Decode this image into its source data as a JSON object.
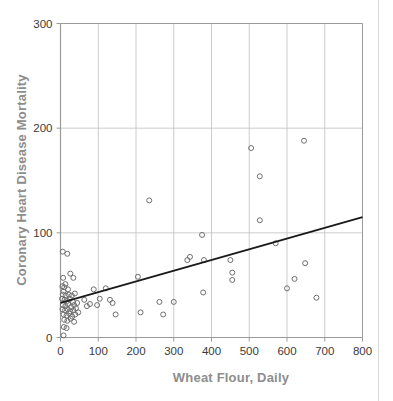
{
  "figure": {
    "background_color": "#ffffff",
    "plot_frame_color": "#9a9a9a",
    "gridline_color": "#bfbfbf",
    "marker_color": "#6f6f6f",
    "trend_line_color": "#1a1a1a",
    "tick_label_color": "#3a3a3a",
    "axis_title_color": "#8d8d8d"
  },
  "chart_data": {
    "type": "scatter",
    "title": "",
    "xlabel": "Wheat Flour, Daily",
    "ylabel": "Coronary Heart Disease Mortality",
    "xlim": [
      0,
      800
    ],
    "ylim": [
      0,
      300
    ],
    "xticks": [
      0,
      100,
      200,
      300,
      400,
      500,
      600,
      700,
      800
    ],
    "yticks": [
      0,
      100,
      200,
      300
    ],
    "xtick_labels": [
      "0",
      "100",
      "200",
      "300",
      "400",
      "500",
      "600",
      "700",
      "800"
    ],
    "ytick_labels": [
      "0",
      "100",
      "200",
      "300"
    ],
    "grid": "vertical-and-horizontal",
    "legend": "none",
    "marker_style": "open-circle",
    "marker_size": 5,
    "trend_line": {
      "label": "linear fit",
      "x_start": 0,
      "y_start": 33,
      "x_end": 800,
      "y_end": 115
    },
    "points": [
      [
        6,
        82
      ],
      [
        18,
        80
      ],
      [
        7,
        57
      ],
      [
        26,
        61
      ],
      [
        34,
        57
      ],
      [
        5,
        49
      ],
      [
        10,
        48
      ],
      [
        13,
        51
      ],
      [
        20,
        46
      ],
      [
        8,
        44
      ],
      [
        6,
        41
      ],
      [
        14,
        40
      ],
      [
        22,
        41
      ],
      [
        30,
        40
      ],
      [
        38,
        42
      ],
      [
        4,
        37
      ],
      [
        11,
        36
      ],
      [
        18,
        35
      ],
      [
        25,
        37
      ],
      [
        33,
        34
      ],
      [
        6,
        31
      ],
      [
        13,
        30
      ],
      [
        20,
        32
      ],
      [
        28,
        29
      ],
      [
        36,
        31
      ],
      [
        44,
        33
      ],
      [
        5,
        27
      ],
      [
        12,
        26
      ],
      [
        19,
        27
      ],
      [
        26,
        25
      ],
      [
        34,
        26
      ],
      [
        41,
        28
      ],
      [
        8,
        22
      ],
      [
        16,
        21
      ],
      [
        23,
        23
      ],
      [
        31,
        20
      ],
      [
        39,
        22
      ],
      [
        47,
        24
      ],
      [
        10,
        17
      ],
      [
        18,
        16
      ],
      [
        27,
        18
      ],
      [
        36,
        15
      ],
      [
        9,
        10
      ],
      [
        16,
        9
      ],
      [
        8,
        2
      ],
      [
        63,
        36
      ],
      [
        70,
        30
      ],
      [
        78,
        32
      ],
      [
        88,
        46
      ],
      [
        97,
        31
      ],
      [
        104,
        37
      ],
      [
        120,
        47
      ],
      [
        131,
        36
      ],
      [
        138,
        33
      ],
      [
        146,
        22
      ],
      [
        205,
        58
      ],
      [
        212,
        24
      ],
      [
        235,
        131
      ],
      [
        262,
        34
      ],
      [
        272,
        22
      ],
      [
        300,
        34
      ],
      [
        336,
        74
      ],
      [
        343,
        77
      ],
      [
        375,
        98
      ],
      [
        380,
        74
      ],
      [
        378,
        43
      ],
      [
        450,
        74
      ],
      [
        455,
        62
      ],
      [
        455,
        55
      ],
      [
        505,
        181
      ],
      [
        528,
        154
      ],
      [
        528,
        112
      ],
      [
        570,
        90
      ],
      [
        600,
        47
      ],
      [
        620,
        56
      ],
      [
        645,
        188
      ],
      [
        648,
        71
      ],
      [
        678,
        38
      ]
    ]
  }
}
